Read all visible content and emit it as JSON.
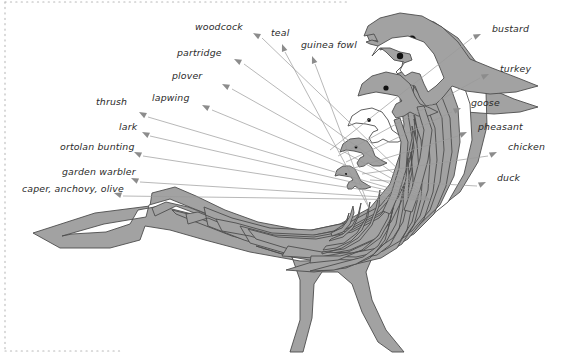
{
  "figure": {
    "colors": {
      "shape_fill": "#a2a2a2",
      "shape_stroke": "#4d4d4d",
      "hole_fill": "#ffffff",
      "leader_line": "#9a9a9a",
      "arrowhead": "#8c8c8c",
      "label_text": "#2b2b2b",
      "edge_dots": "#b9b9b9",
      "background": "#ffffff"
    }
  },
  "labels_left": [
    {
      "text": "woodcock",
      "x": 195,
      "y": 30,
      "anchor": "start",
      "tip_x": 262,
      "tip_y": 38,
      "ax": 253,
      "ay": 33
    },
    {
      "text": "partridge",
      "x": 177,
      "y": 56,
      "anchor": "start",
      "tip_x": 244,
      "tip_y": 64,
      "ax": 234,
      "ay": 59
    },
    {
      "text": "plover",
      "x": 172,
      "y": 79,
      "anchor": "start",
      "tip_x": 232,
      "tip_y": 89,
      "ax": 222,
      "ay": 84
    },
    {
      "text": "lapwing",
      "x": 152,
      "y": 101,
      "anchor": "start",
      "tip_x": 212,
      "tip_y": 110,
      "ax": 202,
      "ay": 105
    },
    {
      "text": "thrush",
      "x": 96,
      "y": 105,
      "anchor": "start",
      "tip_x": 148,
      "tip_y": 117,
      "ax": 139,
      "ay": 112
    },
    {
      "text": "lark",
      "x": 119,
      "y": 130,
      "anchor": "start",
      "tip_x": 150,
      "tip_y": 136,
      "ax": 142,
      "ay": 132
    },
    {
      "text": "ortolan bunting",
      "x": 60,
      "y": 150,
      "anchor": "start",
      "tip_x": 143,
      "tip_y": 156,
      "ax": 134,
      "ay": 152
    },
    {
      "text": "garden warbler",
      "x": 62,
      "y": 175,
      "anchor": "start",
      "tip_x": 140,
      "tip_y": 182,
      "ax": 131,
      "ay": 178
    },
    {
      "text": "caper, anchovy, olive",
      "x": 22,
      "y": 192,
      "anchor": "start",
      "tip_x": 123,
      "tip_y": 196,
      "ax": 114,
      "ay": 193
    }
  ],
  "labels_top": [
    {
      "text": "teal",
      "x": 271,
      "y": 36,
      "anchor": "start",
      "tip_x": 285,
      "tip_y": 52,
      "ax": 282,
      "ay": 44
    },
    {
      "text": "guinea fowl",
      "x": 301,
      "y": 48,
      "anchor": "start",
      "tip_x": 315,
      "tip_y": 64,
      "ax": 312,
      "ay": 56
    }
  ],
  "labels_right": [
    {
      "text": "bustard",
      "x": 492,
      "y": 32,
      "anchor": "start",
      "tip_x": 472,
      "tip_y": 38,
      "ax": 481,
      "ay": 34
    },
    {
      "text": "turkey",
      "x": 500,
      "y": 72,
      "anchor": "start",
      "tip_x": 480,
      "tip_y": 78,
      "ax": 489,
      "ay": 74
    },
    {
      "text": "goose",
      "x": 471,
      "y": 106,
      "anchor": "start",
      "tip_x": 452,
      "tip_y": 112,
      "ax": 461,
      "ay": 108
    },
    {
      "text": "pheasant",
      "x": 478,
      "y": 130,
      "anchor": "start",
      "tip_x": 458,
      "tip_y": 136,
      "ax": 467,
      "ay": 132
    },
    {
      "text": "chicken",
      "x": 508,
      "y": 150,
      "anchor": "start",
      "tip_x": 488,
      "tip_y": 156,
      "ax": 497,
      "ay": 152
    },
    {
      "text": "duck",
      "x": 497,
      "y": 181,
      "anchor": "start",
      "tip_x": 477,
      "tip_y": 186,
      "ax": 486,
      "ay": 182
    }
  ],
  "leader_sources": {
    "left_fan_origin_x": 430,
    "left_fan_origin_y": 200,
    "note": "Left and top leader lines fan out from the nested rings inside the bird body toward the labels."
  },
  "edge_decoration": {
    "left_dotted_line": true,
    "top_dotted_line": true,
    "bottom_dotted_line": true
  }
}
